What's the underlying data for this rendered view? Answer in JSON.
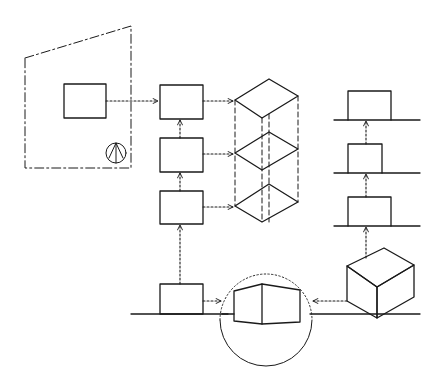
{
  "diagram": {
    "title": "",
    "style": "hand-drawn architectural concept sketch",
    "colors": {
      "ink": "#1a1a1a",
      "background": "#ffffff"
    },
    "site": {
      "boundary": [
        [
          25,
          58
        ],
        [
          131,
          26
        ],
        [
          131,
          168
        ],
        [
          25,
          168
        ]
      ],
      "building": {
        "x": 64,
        "y": 84,
        "w": 42,
        "h": 34
      },
      "north_arrow": {
        "icon": "north-arrow-icon",
        "cx": 116,
        "cy": 153,
        "r": 10
      }
    },
    "middle_column": {
      "boxes": [
        {
          "x": 160,
          "y": 85,
          "w": 43,
          "h": 34
        },
        {
          "x": 160,
          "y": 138,
          "w": 43,
          "h": 34
        },
        {
          "x": 160,
          "y": 191,
          "w": 43,
          "h": 33
        },
        {
          "x": 160,
          "y": 284,
          "w": 43,
          "h": 30
        }
      ],
      "ground_line": {
        "x1": 131,
        "x2": 228,
        "y": 314
      }
    },
    "iso_stack": {
      "plates": [
        {
          "left": [
            235,
            100
          ],
          "top": [
            269,
            79
          ],
          "right": [
            298,
            96
          ],
          "front": [
            262,
            118
          ]
        },
        {
          "left": [
            235,
            153
          ],
          "top": [
            269,
            132
          ],
          "right": [
            298,
            149
          ],
          "front": [
            262,
            170
          ]
        },
        {
          "left": [
            235,
            206
          ],
          "top": [
            269,
            184
          ],
          "right": [
            298,
            202
          ],
          "front": [
            262,
            222
          ]
        }
      ],
      "vertical_edges": [
        {
          "x": 235,
          "y1": 100,
          "y2": 206
        },
        {
          "x": 262,
          "y1": 118,
          "y2": 222
        },
        {
          "x": 298,
          "y1": 96,
          "y2": 202
        },
        {
          "x": 269,
          "y1": 114,
          "y2": 222
        }
      ]
    },
    "right_column": {
      "levels": [
        {
          "ground_y": 120,
          "box": {
            "x": 348,
            "y": 91,
            "w": 43,
            "h": 29
          }
        },
        {
          "ground_y": 173,
          "box": {
            "x": 348,
            "y": 144,
            "w": 34,
            "h": 29
          }
        },
        {
          "ground_y": 226,
          "box": {
            "x": 348,
            "y": 197,
            "w": 43,
            "h": 29
          }
        }
      ],
      "line_x1": 334,
      "line_x2": 420
    },
    "focus_circle": {
      "cx": 266,
      "cy": 320,
      "r": 46
    },
    "focus_building": {
      "outline": [
        [
          234,
          291
        ],
        [
          262,
          284
        ],
        [
          300,
          290
        ],
        [
          300,
          322
        ],
        [
          262,
          324
        ],
        [
          234,
          321
        ]
      ],
      "ridge": {
        "x": 262,
        "y1": 284,
        "y2": 324
      }
    },
    "cube": {
      "top": [
        384,
        248
      ],
      "left": [
        347,
        266
      ],
      "right": [
        414,
        265
      ],
      "front": [
        377,
        287
      ],
      "bottom": [
        377,
        318
      ],
      "left_bottom": [
        347,
        301
      ],
      "right_bottom": [
        414,
        297
      ]
    },
    "ground_line_right": {
      "x1": 310,
      "x2": 420,
      "y": 314
    },
    "flows": [
      {
        "from": "site-building",
        "to": "middle-box-1",
        "points": [
          [
            106,
            101
          ],
          [
            158,
            101
          ]
        ],
        "direction": "right"
      },
      {
        "from": "middle-box-1",
        "to": "iso-plate-1",
        "points": [
          [
            203,
            101
          ],
          [
            233,
            101
          ]
        ],
        "direction": "right"
      },
      {
        "from": "middle-box-2",
        "to": "iso-plate-2",
        "points": [
          [
            203,
            154
          ],
          [
            233,
            154
          ]
        ],
        "direction": "right"
      },
      {
        "from": "middle-box-3",
        "to": "iso-plate-3",
        "points": [
          [
            203,
            207
          ],
          [
            233,
            207
          ]
        ],
        "direction": "right"
      },
      {
        "from": "middle-box-2",
        "to": "middle-box-1",
        "points": [
          [
            180,
            138
          ],
          [
            180,
            120
          ]
        ],
        "direction": "up"
      },
      {
        "from": "middle-box-3",
        "to": "middle-box-2",
        "points": [
          [
            180,
            191
          ],
          [
            180,
            173
          ]
        ],
        "direction": "up"
      },
      {
        "from": "middle-box-4",
        "to": "middle-box-3",
        "points": [
          [
            180,
            284
          ],
          [
            180,
            225
          ]
        ],
        "direction": "up"
      },
      {
        "from": "middle-box-4",
        "to": "focus-circle",
        "points": [
          [
            203,
            301
          ],
          [
            221,
            301
          ]
        ],
        "direction": "right"
      },
      {
        "from": "cube",
        "to": "focus-circle",
        "points": [
          [
            347,
            301
          ],
          [
            313,
            301
          ]
        ],
        "direction": "left"
      },
      {
        "from": "cube",
        "to": "right-level-3",
        "points": [
          [
            366,
            258
          ],
          [
            366,
            227
          ]
        ],
        "direction": "up"
      },
      {
        "from": "right-level-3",
        "to": "right-level-2",
        "points": [
          [
            366,
            197
          ],
          [
            366,
            174
          ]
        ],
        "direction": "up"
      },
      {
        "from": "right-level-2",
        "to": "right-level-1",
        "points": [
          [
            366,
            144
          ],
          [
            366,
            121
          ]
        ],
        "direction": "up"
      }
    ]
  }
}
